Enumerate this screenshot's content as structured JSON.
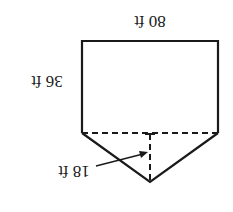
{
  "diagram": {
    "orientation": "rotated 180 degrees",
    "shape": "pentagon (rectangle with triangle)",
    "labels": {
      "width": "80 ft",
      "height": "36 ft",
      "triangle_height": "18 ft"
    },
    "colors": {
      "stroke": "#1a1a1a",
      "background": "#ffffff"
    }
  }
}
